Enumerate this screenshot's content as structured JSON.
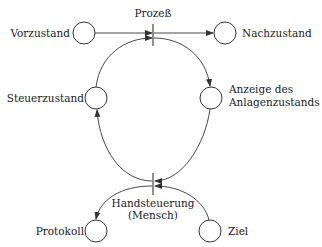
{
  "diagram": {
    "type": "petri-net",
    "places": [
      {
        "id": "vorzustand",
        "label": "Vorzustand"
      },
      {
        "id": "nachzustand",
        "label": "Nachzustand"
      },
      {
        "id": "steuerzustand",
        "label": "Steuerzustand"
      },
      {
        "id": "anzeige",
        "label_line1": "Anzeige des",
        "label_line2": "Anlagenzustands"
      },
      {
        "id": "protokoll",
        "label": "Protokoll"
      },
      {
        "id": "ziel",
        "label": "Ziel"
      }
    ],
    "transitions": [
      {
        "id": "prozess",
        "label": "Prozeß"
      },
      {
        "id": "handsteuerung",
        "label_line1": "Handsteuerung",
        "label_line2": "(Mensch)"
      }
    ],
    "arcs": [
      {
        "from": "vorzustand",
        "to": "prozess"
      },
      {
        "from": "prozess",
        "to": "nachzustand"
      },
      {
        "from": "steuerzustand",
        "to": "prozess"
      },
      {
        "from": "prozess",
        "to": "anzeige"
      },
      {
        "from": "anzeige",
        "to": "handsteuerung"
      },
      {
        "from": "handsteuerung",
        "to": "steuerzustand"
      },
      {
        "from": "ziel",
        "to": "handsteuerung"
      },
      {
        "from": "handsteuerung",
        "to": "protokoll"
      }
    ]
  }
}
